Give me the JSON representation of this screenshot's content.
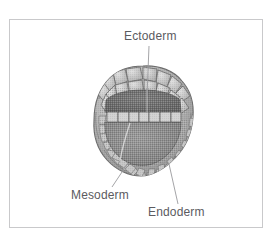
{
  "figure": {
    "type": "scientific-illustration",
    "rendering": "grayscale halftone line drawing",
    "frame": {
      "visible": true,
      "border_color": "#c9c9cb",
      "background_color": "#ffffff"
    },
    "labels": [
      {
        "id": "ectoderm",
        "text": "Ectoderm",
        "position": "top-center",
        "color": "#5b5b5f",
        "leader_line": {
          "from": [
            149,
            46
          ],
          "to": [
            147,
            96
          ],
          "color": "#9a9a9d"
        }
      },
      {
        "id": "mesoderm",
        "text": "Mesoderm",
        "position": "bottom-left",
        "color": "#5b5b5f",
        "leader_line": {
          "from": [
            112,
            187
          ],
          "to": [
            128,
            163
          ],
          "color": "#9a9a9d"
        }
      },
      {
        "id": "endoderm",
        "text": "Endoderm",
        "position": "bottom-right",
        "color": "#5b5b5f",
        "leader_line": {
          "from": [
            178,
            204
          ],
          "to": [
            169,
            164
          ],
          "color": "#9a9a9d"
        }
      }
    ],
    "embryo": {
      "shape": "roughly circular lobed sphere",
      "bounds": {
        "x": 95,
        "y": 66,
        "width": 97,
        "height": 110
      },
      "regions": [
        {
          "name": "outer-cell-layer",
          "label": "Ectoderm",
          "description": "ring of large cobblestone cells forming the outer surface",
          "fill": "#b9b9b9"
        },
        {
          "name": "inner-cell-mass",
          "label": "Mesoderm",
          "description": "small packed cells lining the inner wall",
          "fill": "#a4a4a4"
        },
        {
          "name": "gut-cell-row",
          "label": "Endoderm",
          "description": "row of cells lining the archenteron",
          "fill": "#c3c3c3"
        },
        {
          "name": "archenteron-cavity",
          "description": "dark upper cavity",
          "fill": "#6f6f6f"
        },
        {
          "name": "blastocoel",
          "description": "lighter lower cavity",
          "fill": "#8d8d8d"
        }
      ]
    }
  }
}
